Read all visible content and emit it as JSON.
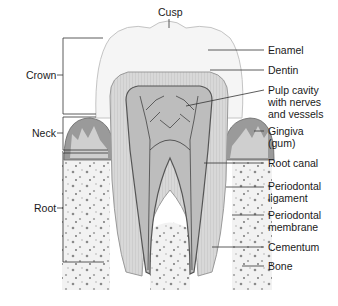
{
  "diagram": {
    "type": "anatomical-illustration",
    "regions": {
      "crown": "Crown",
      "neck": "Neck",
      "root": "Root"
    },
    "top_label": "Cusp",
    "labels": {
      "enamel": "Enamel",
      "dentin": "Dentin",
      "pulp_1": "Pulp cavity",
      "pulp_2": "with nerves",
      "pulp_3": "and vessels",
      "gingiva_1": "Gingiva",
      "gingiva_2": "(gum)",
      "root_canal": "Root canal",
      "perio_lig_1": "Periodontal",
      "perio_lig_2": "ligament",
      "perio_mem_1": "Periodontal",
      "perio_mem_2": "membrane",
      "cementum": "Cementum",
      "bone": "Bone"
    },
    "colors": {
      "enamel": "#f4f4f4",
      "dentin": "#d2d2d2",
      "pulp": "#bdbdbd",
      "gum": "#8f8f8f",
      "bone": "#efefef",
      "line": "#333333"
    }
  }
}
